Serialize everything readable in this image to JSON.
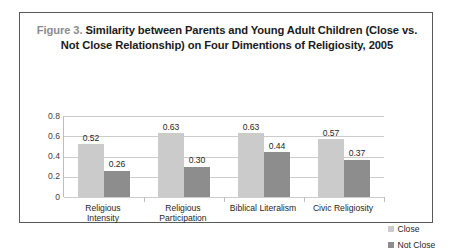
{
  "figure": {
    "title_prefix": "Figure 3.",
    "title_rest": " Similarity between Parents and Young Adult Children (Close vs. Not Close Relationship) on Four Dimentions of Religiosity, 2005",
    "title_full": "Figure 3. Similarity between Parents and Young Adult Children (Close vs. Not Close Relationship) on Four Dimentions of Religiosity, 2005",
    "border_color": "#58595b"
  },
  "chart_data": {
    "type": "bar",
    "title": "Figure 3. Similarity between Parents and Young Adult Children (Close vs. Not Close Relationship) on Four Dimentions of Religiosity, 2005",
    "xlabel": "",
    "ylabel": "",
    "ylim": [
      0,
      0.8
    ],
    "yticks": [
      "0",
      "0.2",
      "0.4",
      "0.6",
      "0.8"
    ],
    "ytick_values": [
      0,
      0.2,
      0.4,
      0.6,
      0.8
    ],
    "grid": true,
    "legend_position": "right",
    "categories": [
      "Religious Intensity",
      "Religious Participation",
      "Biblical Literalism",
      "Civic Religiosity"
    ],
    "category_lines": [
      [
        "Religious",
        "Intensity"
      ],
      [
        "Religious",
        "Participation"
      ],
      [
        "Biblical Literalism"
      ],
      [
        "Civic Religiosity"
      ]
    ],
    "series": [
      {
        "name": "Close",
        "color": "#cbcbcb",
        "values": [
          0.52,
          0.63,
          0.63,
          0.57
        ],
        "labels": [
          "0.52",
          "0.63",
          "0.63",
          "0.57"
        ]
      },
      {
        "name": "Not Close",
        "color": "#8d8d8d",
        "values": [
          0.26,
          0.3,
          0.44,
          0.37
        ],
        "labels": [
          "0.26",
          "0.30",
          "0.44",
          "0.37"
        ]
      }
    ]
  },
  "legend": {
    "items": [
      {
        "label": "Close",
        "color": "#cbcbcb"
      },
      {
        "label": "Not Close",
        "color": "#8d8d8d"
      }
    ]
  }
}
